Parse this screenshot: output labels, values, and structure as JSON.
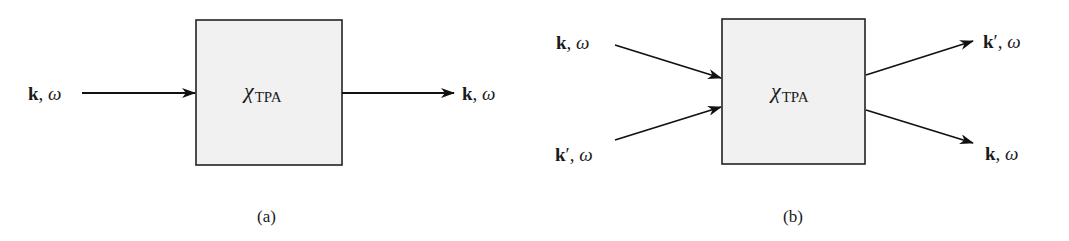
{
  "figure": {
    "panels": [
      {
        "id": "a",
        "caption": "(a)",
        "block": {
          "symbol": "χ",
          "subscript": "TPA",
          "fill": "#f1f1f1"
        },
        "inputs": [
          {
            "vector": "k",
            "prime": "",
            "sep": ", ",
            "freq": "ω"
          }
        ],
        "outputs": [
          {
            "vector": "k",
            "prime": "",
            "sep": ", ",
            "freq": "ω"
          }
        ]
      },
      {
        "id": "b",
        "caption": "(b)",
        "block": {
          "symbol": "χ",
          "subscript": "TPA",
          "fill": "#f1f1f1"
        },
        "inputs": [
          {
            "vector": "k",
            "prime": "",
            "sep": ", ",
            "freq": "ω"
          },
          {
            "vector": "k",
            "prime": "′",
            "sep": ", ",
            "freq": "ω"
          }
        ],
        "outputs": [
          {
            "vector": "k",
            "prime": "′",
            "sep": ", ",
            "freq": "ω"
          },
          {
            "vector": "k",
            "prime": "",
            "sep": ", ",
            "freq": "ω"
          }
        ]
      }
    ]
  }
}
